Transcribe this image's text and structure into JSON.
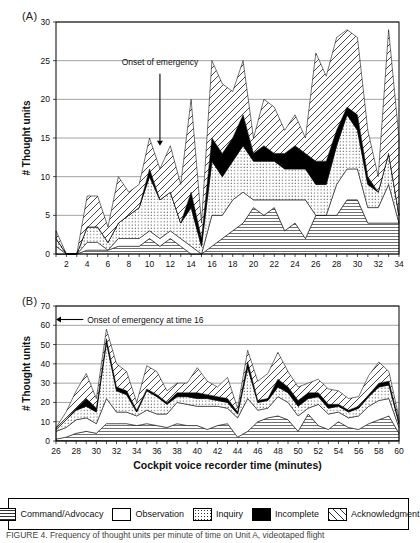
{
  "figure": {
    "panel_a_label": "(A)",
    "panel_b_label": "(B)",
    "caption": "FIGURE 4.  Frequency of thought units per minute of time on Unit A, videotaped flight"
  },
  "legend": {
    "items": [
      {
        "label": "Command/Advocacy",
        "pattern": "horizontal-dense-hatch",
        "icon": "swatch-command-advocacy"
      },
      {
        "label": "Observation",
        "pattern": "solid-white",
        "icon": "swatch-observation"
      },
      {
        "label": "Inquiry",
        "pattern": "dotted",
        "icon": "swatch-inquiry"
      },
      {
        "label": "Incomplete",
        "pattern": "solid-black",
        "icon": "swatch-incomplete"
      },
      {
        "label": "Acknowledgment",
        "pattern": "diagonal-hatch",
        "icon": "swatch-acknowledgment"
      }
    ]
  },
  "chart_data": [
    {
      "id": "panel-a",
      "type": "area",
      "stacked": true,
      "title": "(A)",
      "xlabel": "",
      "ylabel": "# Thought units",
      "xlim": [
        1,
        34
      ],
      "ylim": [
        0,
        30
      ],
      "ytick_step": 5,
      "yticks": [
        0,
        5,
        10,
        15,
        20,
        25,
        30
      ],
      "xticks": [
        2,
        4,
        6,
        8,
        10,
        12,
        14,
        16,
        18,
        20,
        22,
        24,
        26,
        28,
        30,
        32,
        34
      ],
      "grid": "horizontal",
      "legend_position": "bottom-shared",
      "annotation": {
        "text": "Onset of emergency",
        "arrow": "down",
        "x": 11,
        "y_text": 24.5,
        "y_tip": 14
      },
      "x": [
        1,
        2,
        3,
        4,
        5,
        6,
        7,
        8,
        9,
        10,
        11,
        12,
        13,
        14,
        15,
        16,
        17,
        18,
        19,
        20,
        21,
        22,
        23,
        24,
        25,
        26,
        27,
        28,
        29,
        30,
        31,
        32,
        33,
        34
      ],
      "series": [
        {
          "name": "Command/Advocacy",
          "pattern": "horizontal-dense-hatch",
          "values": [
            0,
            0,
            0,
            0.5,
            0.5,
            0.5,
            1,
            1,
            1,
            2,
            1,
            2,
            1,
            0,
            0,
            1,
            2,
            3,
            4,
            6,
            5,
            6,
            3,
            4,
            2,
            5,
            5,
            5,
            7,
            7,
            4,
            4,
            4,
            4
          ]
        },
        {
          "name": "Observation",
          "pattern": "solid-white",
          "values": [
            1,
            0,
            0,
            1,
            1,
            0,
            1,
            1,
            1,
            1,
            1,
            1,
            1,
            1,
            0,
            4,
            3,
            4,
            4,
            1,
            2,
            1,
            4,
            3,
            5,
            0,
            0,
            4,
            4,
            4,
            2,
            2,
            5,
            0
          ]
        },
        {
          "name": "Inquiry",
          "pattern": "dotted",
          "values": [
            1,
            0,
            0,
            2,
            2,
            1,
            2,
            3,
            4,
            7,
            5,
            5,
            2,
            5,
            1,
            7,
            5,
            5,
            6,
            5,
            5,
            5,
            4,
            4,
            4,
            4,
            4,
            5,
            7,
            5,
            3,
            2,
            4,
            1
          ]
        },
        {
          "name": "Incomplete",
          "pattern": "solid-black",
          "values": [
            0,
            0,
            0,
            0,
            0,
            0,
            0,
            0,
            0,
            1,
            0,
            0,
            0,
            2,
            1,
            3,
            3,
            3,
            4,
            1,
            2,
            1,
            2,
            3,
            2,
            3,
            3,
            2,
            1,
            2,
            1,
            0,
            0,
            0
          ]
        },
        {
          "name": "Acknowledgment",
          "pattern": "diagonal-hatch",
          "values": [
            1,
            0,
            0,
            4,
            4,
            2,
            6,
            3,
            3,
            4,
            4,
            6,
            5,
            12,
            2,
            10,
            9,
            6,
            7,
            2,
            6,
            6,
            3,
            4,
            2,
            14,
            11,
            12,
            10,
            10,
            6,
            2,
            16,
            10
          ]
        }
      ]
    },
    {
      "id": "panel-b",
      "type": "area",
      "stacked": true,
      "title": "(B)",
      "xlabel": "Cockpit voice recorder time (minutes)",
      "ylabel": "# Thought units",
      "xlim": [
        26,
        60
      ],
      "ylim": [
        0,
        70
      ],
      "ytick_step": 10,
      "yticks": [
        0,
        10,
        20,
        30,
        40,
        50,
        60,
        70
      ],
      "xticks": [
        26,
        28,
        30,
        32,
        34,
        36,
        38,
        40,
        42,
        44,
        46,
        48,
        50,
        52,
        54,
        56,
        58,
        60
      ],
      "grid": "horizontal",
      "legend_position": "bottom-shared",
      "annotation": {
        "text": "Onset of emergency at time 16",
        "arrow": "left",
        "x_text": 29,
        "y_text": 63,
        "x_tip": 26
      },
      "x": [
        26,
        27,
        28,
        29,
        30,
        31,
        32,
        33,
        34,
        35,
        36,
        37,
        38,
        39,
        40,
        41,
        42,
        43,
        44,
        45,
        46,
        47,
        48,
        49,
        50,
        51,
        52,
        53,
        54,
        55,
        56,
        57,
        58,
        59,
        60
      ],
      "series": [
        {
          "name": "Command/Advocacy",
          "pattern": "horizontal-dense-hatch",
          "values": [
            1,
            2,
            4,
            5,
            4,
            9,
            9,
            9,
            8,
            9,
            8,
            7,
            9,
            8,
            8,
            6,
            8,
            9,
            2,
            5,
            10,
            12,
            13,
            11,
            5,
            14,
            8,
            6,
            10,
            7,
            6,
            9,
            11,
            13,
            4
          ]
        },
        {
          "name": "Observation",
          "pattern": "solid-white",
          "values": [
            4,
            5,
            7,
            7,
            5,
            13,
            6,
            6,
            5,
            7,
            6,
            7,
            11,
            11,
            10,
            12,
            10,
            8,
            10,
            17,
            6,
            5,
            10,
            9,
            8,
            3,
            11,
            8,
            5,
            5,
            7,
            9,
            10,
            9,
            3
          ]
        },
        {
          "name": "Inquiry",
          "pattern": "dotted",
          "values": [
            1,
            4,
            5,
            6,
            6,
            29,
            11,
            9,
            2,
            10,
            9,
            5,
            3,
            4,
            4,
            4,
            3,
            3,
            2,
            16,
            4,
            4,
            5,
            5,
            5,
            5,
            4,
            3,
            3,
            3,
            4,
            5,
            7,
            7,
            2
          ]
        },
        {
          "name": "Incomplete",
          "pattern": "solid-black",
          "values": [
            0,
            0,
            1,
            4,
            2,
            2,
            2,
            2,
            1,
            1,
            1,
            1,
            2,
            2,
            3,
            2,
            2,
            2,
            1,
            3,
            1,
            1,
            4,
            3,
            3,
            3,
            2,
            2,
            1,
            1,
            1,
            1,
            2,
            2,
            1
          ]
        },
        {
          "name": "Acknowledgment",
          "pattern": "diagonal-hatch",
          "values": [
            1,
            4,
            9,
            13,
            5,
            5,
            12,
            10,
            4,
            12,
            12,
            6,
            5,
            5,
            13,
            7,
            5,
            11,
            2,
            6,
            10,
            13,
            14,
            8,
            7,
            5,
            7,
            8,
            7,
            6,
            5,
            10,
            11,
            5,
            2
          ]
        }
      ]
    }
  ]
}
